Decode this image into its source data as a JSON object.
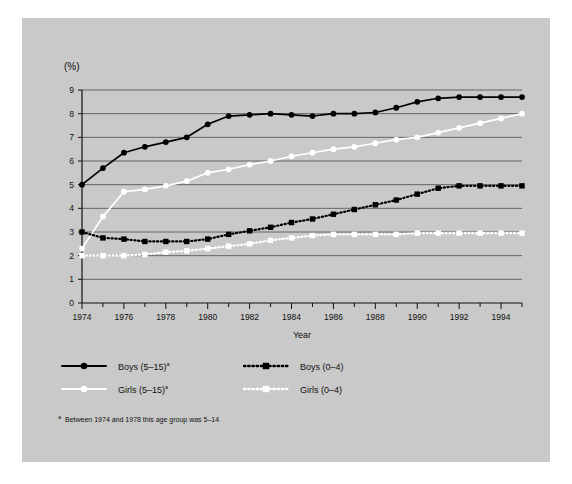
{
  "figure": {
    "panel_background": "#c9c9c9",
    "plot_background": "#c9c9c9"
  },
  "axes": {
    "y_unit_label": "(%)",
    "x_title": "Year",
    "y_ticks": [
      "0",
      "1",
      "2",
      "3",
      "4",
      "5",
      "6",
      "7",
      "8",
      "9"
    ],
    "x_ticks": [
      "1974",
      "1976",
      "1978",
      "1980",
      "1982",
      "1984",
      "1986",
      "1988",
      "1990",
      "1992",
      "1994"
    ]
  },
  "legend": {
    "items": [
      {
        "label": "Boys (5–15)",
        "superscript": "a",
        "marker": "circle",
        "line": "solid",
        "color": "#000000"
      },
      {
        "label": "Boys (0–4)",
        "superscript": "",
        "marker": "square",
        "line": "dotted",
        "color": "#000000"
      },
      {
        "label": "Girls (5–15)",
        "superscript": "a",
        "marker": "circle",
        "line": "solid",
        "color": "#ffffff"
      },
      {
        "label": "Girls (0–4)",
        "superscript": "",
        "marker": "square",
        "line": "dotted",
        "color": "#ffffff"
      }
    ]
  },
  "footnote": {
    "marker": "a",
    "text": "Between 1974 and 1978 this age group was 5–14"
  },
  "chart_data": {
    "type": "line",
    "title": "",
    "xlabel": "Year",
    "ylabel": "(%)",
    "xlim": [
      1974,
      1995
    ],
    "ylim": [
      0,
      9
    ],
    "grid": true,
    "legend_position": "below-left",
    "x": [
      1974,
      1975,
      1976,
      1977,
      1978,
      1979,
      1980,
      1981,
      1982,
      1983,
      1984,
      1985,
      1986,
      1987,
      1988,
      1989,
      1990,
      1991,
      1992,
      1993,
      1994,
      1995
    ],
    "series": [
      {
        "name": "Boys (5–15)",
        "color": "#000000",
        "marker": "circle",
        "line": "solid",
        "values": [
          5.0,
          5.7,
          6.35,
          6.6,
          6.8,
          7.0,
          7.55,
          7.9,
          7.95,
          8.0,
          7.95,
          7.9,
          8.0,
          8.0,
          8.05,
          8.25,
          8.5,
          8.65,
          8.7,
          8.7,
          8.7,
          8.7
        ]
      },
      {
        "name": "Girls (5–15)",
        "color": "#ffffff",
        "marker": "circle",
        "line": "solid",
        "values": [
          2.3,
          3.65,
          4.7,
          4.8,
          4.95,
          5.15,
          5.5,
          5.65,
          5.85,
          6.0,
          6.2,
          6.35,
          6.5,
          6.6,
          6.75,
          6.9,
          7.0,
          7.2,
          7.4,
          7.6,
          7.8,
          8.0
        ]
      },
      {
        "name": "Boys (0–4)",
        "color": "#000000",
        "marker": "square",
        "line": "dotted",
        "values": [
          3.0,
          2.75,
          2.7,
          2.6,
          2.6,
          2.6,
          2.7,
          2.9,
          3.05,
          3.2,
          3.4,
          3.55,
          3.75,
          3.95,
          4.15,
          4.35,
          4.6,
          4.85,
          4.95,
          4.95,
          4.95,
          4.95
        ]
      },
      {
        "name": "Girls (0–4)",
        "color": "#ffffff",
        "marker": "square",
        "line": "dotted",
        "values": [
          2.0,
          2.0,
          2.0,
          2.05,
          2.15,
          2.2,
          2.3,
          2.4,
          2.5,
          2.65,
          2.75,
          2.85,
          2.9,
          2.9,
          2.9,
          2.9,
          2.95,
          2.95,
          2.95,
          2.95,
          2.95,
          2.95
        ]
      }
    ]
  }
}
